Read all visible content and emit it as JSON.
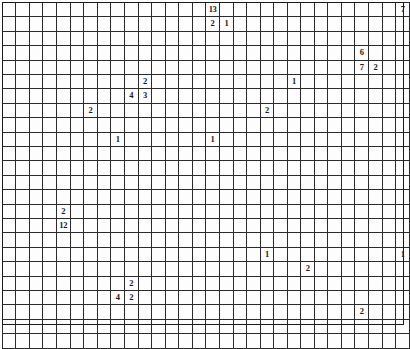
{
  "grid": {
    "columns": 30,
    "rows": 24,
    "cell_size_px": 13.4,
    "origin_x_px": 2,
    "origin_y_px": 2,
    "line_color": "#2b2b2b",
    "background_color": "#ffffff",
    "text_color": "#1a1a1a",
    "entries": [
      {
        "row": 0,
        "col": 15,
        "value": "13"
      },
      {
        "row": 0,
        "col": 29,
        "value": "7"
      },
      {
        "row": 1,
        "col": 15,
        "value": "2"
      },
      {
        "row": 1,
        "col": 16,
        "value": "1"
      },
      {
        "row": 3,
        "col": 26,
        "value": "6"
      },
      {
        "row": 4,
        "col": 26,
        "value": "7"
      },
      {
        "row": 4,
        "col": 27,
        "value": "2"
      },
      {
        "row": 5,
        "col": 10,
        "value": "2"
      },
      {
        "row": 5,
        "col": 21,
        "value": "1"
      },
      {
        "row": 6,
        "col": 9,
        "value": "4"
      },
      {
        "row": 6,
        "col": 10,
        "value": "3"
      },
      {
        "row": 7,
        "col": 6,
        "value": "2"
      },
      {
        "row": 7,
        "col": 19,
        "value": "2"
      },
      {
        "row": 7,
        "col": 30,
        "value": "1"
      },
      {
        "row": 9,
        "col": 8,
        "value": "1"
      },
      {
        "row": 9,
        "col": 15,
        "value": "1"
      },
      {
        "row": 14,
        "col": 4,
        "value": "2"
      },
      {
        "row": 15,
        "col": 4,
        "value": "12"
      },
      {
        "row": 17,
        "col": 19,
        "value": "1"
      },
      {
        "row": 17,
        "col": 29,
        "value": "1"
      },
      {
        "row": 18,
        "col": 22,
        "value": "2"
      },
      {
        "row": 19,
        "col": 9,
        "value": "2"
      },
      {
        "row": 20,
        "col": 8,
        "value": "4"
      },
      {
        "row": 20,
        "col": 9,
        "value": "2"
      },
      {
        "row": 21,
        "col": 26,
        "value": "2"
      },
      {
        "row": 23,
        "col": 30,
        "value": "1"
      }
    ]
  }
}
